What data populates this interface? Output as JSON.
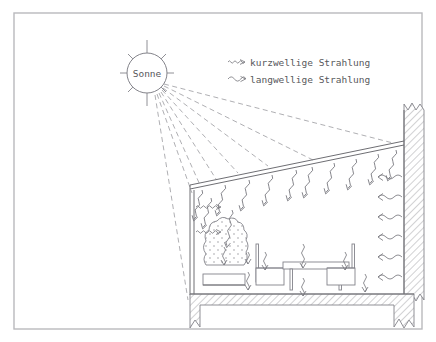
{
  "figure": {
    "title_text": "",
    "background_color": "#ffffff",
    "border_color": "#b9b9bd",
    "line_color": "#6e6e73",
    "text_color": "#58585c"
  },
  "sun": {
    "label": "Sonne",
    "ray_count": 8
  },
  "legend": {
    "items": [
      {
        "symbol_name": "shortwave-squiggle-arrow",
        "label": "kurzwellige Strahlung",
        "wavelength": "short"
      },
      {
        "symbol_name": "longwave-squiggle-arrow",
        "label": "langwellige Strahlung",
        "wavelength": "long"
      }
    ]
  },
  "scene": {
    "sunbeam_count": 8,
    "ceiling_arrow_count": 12,
    "left_wall_arrow_count": 2,
    "right_wall_arrow_count": 6,
    "interior_arrow_count": 8,
    "furniture": [
      {
        "name": "armchair"
      },
      {
        "name": "chair-left"
      },
      {
        "name": "table"
      },
      {
        "name": "chair-right"
      }
    ],
    "elements": [
      {
        "name": "sloped-glass-roof"
      },
      {
        "name": "left-glass-wall"
      },
      {
        "name": "right-masonry-wall"
      },
      {
        "name": "floor-slab"
      }
    ]
  }
}
